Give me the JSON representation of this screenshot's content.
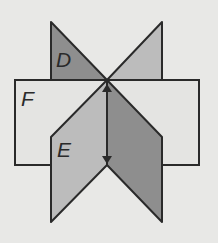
{
  "diagram": {
    "type": "intersecting-planes",
    "background_color": "#e8e8e6",
    "planes": [
      {
        "label": "D",
        "shape": "vertical plane (left-top triangle + right-bottom parallelogram)",
        "fill": "#8e8e8e"
      },
      {
        "label": "E",
        "shape": "vertical plane (right-top triangle + left-bottom parallelogram)",
        "fill": "#bcbcbc"
      },
      {
        "label": "F",
        "shape": "horizontal rectangle",
        "fill": "#e4e4e2"
      }
    ],
    "intersection_line": {
      "style": "double-headed arrow",
      "orientation": "vertical"
    },
    "labels": {
      "D": "D",
      "E": "E",
      "F": "F"
    },
    "stroke_color": "#2a2a2a"
  }
}
